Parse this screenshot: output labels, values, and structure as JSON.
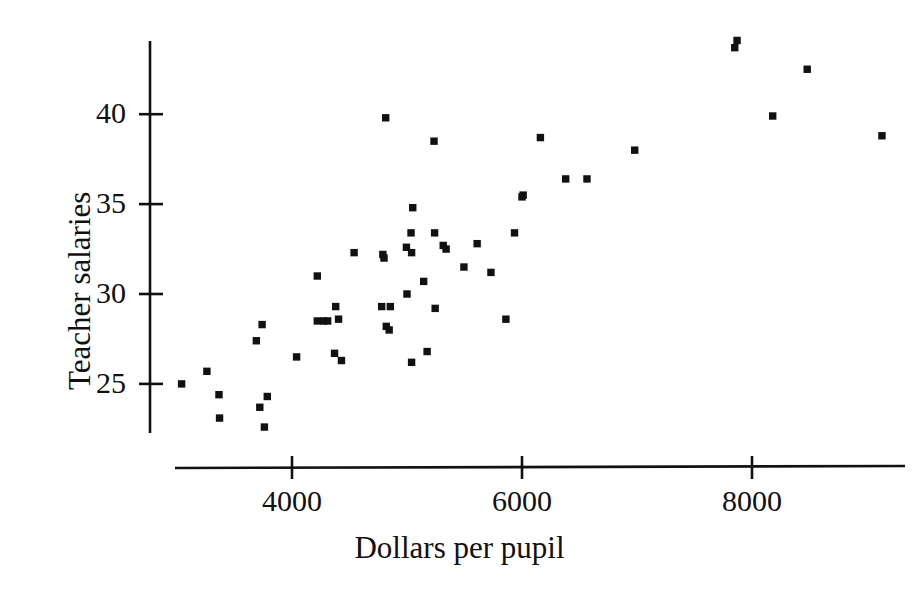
{
  "chart_data": {
    "type": "scatter",
    "title": "",
    "xlabel": "Dollars per pupil",
    "ylabel": "Teacher salaries",
    "xticks": [
      "4000",
      "6000",
      "8000"
    ],
    "xtick_values": [
      4000,
      6000,
      8000
    ],
    "yticks": [
      "25",
      "30",
      "35",
      "40"
    ],
    "ytick_values": [
      25,
      30,
      35,
      40
    ],
    "xlim": [
      3000,
      9300
    ],
    "ylim": [
      22.0,
      45.5
    ],
    "grid": false,
    "legend": null,
    "marker": "square",
    "marker_color": "#111111",
    "points": [
      {
        "x": 3040,
        "y": 25.0
      },
      {
        "x": 3260,
        "y": 25.7
      },
      {
        "x": 3365,
        "y": 24.4
      },
      {
        "x": 3370,
        "y": 23.1
      },
      {
        "x": 3690,
        "y": 27.4
      },
      {
        "x": 3740,
        "y": 28.3
      },
      {
        "x": 3720,
        "y": 23.7
      },
      {
        "x": 3785,
        "y": 24.3
      },
      {
        "x": 3760,
        "y": 22.6
      },
      {
        "x": 4040,
        "y": 26.5
      },
      {
        "x": 4220,
        "y": 31.0
      },
      {
        "x": 4220,
        "y": 28.5
      },
      {
        "x": 4275,
        "y": 28.5
      },
      {
        "x": 4310,
        "y": 28.5
      },
      {
        "x": 4370,
        "y": 26.7
      },
      {
        "x": 4380,
        "y": 29.3
      },
      {
        "x": 4405,
        "y": 28.6
      },
      {
        "x": 4430,
        "y": 26.3
      },
      {
        "x": 4540,
        "y": 32.3
      },
      {
        "x": 4780,
        "y": 29.3
      },
      {
        "x": 4790,
        "y": 32.2
      },
      {
        "x": 4800,
        "y": 32.0
      },
      {
        "x": 4815,
        "y": 39.8
      },
      {
        "x": 4820,
        "y": 28.2
      },
      {
        "x": 4845,
        "y": 28.0
      },
      {
        "x": 4855,
        "y": 29.3
      },
      {
        "x": 4995,
        "y": 32.6
      },
      {
        "x": 5000,
        "y": 30.0
      },
      {
        "x": 5035,
        "y": 33.4
      },
      {
        "x": 5040,
        "y": 32.3
      },
      {
        "x": 5040,
        "y": 26.2
      },
      {
        "x": 5050,
        "y": 34.8
      },
      {
        "x": 5145,
        "y": 30.7
      },
      {
        "x": 5175,
        "y": 26.8
      },
      {
        "x": 5235,
        "y": 38.5
      },
      {
        "x": 5240,
        "y": 33.4
      },
      {
        "x": 5245,
        "y": 29.2
      },
      {
        "x": 5315,
        "y": 32.7
      },
      {
        "x": 5340,
        "y": 32.5
      },
      {
        "x": 5495,
        "y": 31.5
      },
      {
        "x": 5610,
        "y": 32.8
      },
      {
        "x": 5730,
        "y": 31.2
      },
      {
        "x": 5860,
        "y": 28.6
      },
      {
        "x": 5935,
        "y": 33.4
      },
      {
        "x": 6000,
        "y": 35.4
      },
      {
        "x": 6010,
        "y": 35.5
      },
      {
        "x": 6160,
        "y": 38.7
      },
      {
        "x": 6380,
        "y": 36.4
      },
      {
        "x": 6565,
        "y": 36.4
      },
      {
        "x": 6980,
        "y": 38.0
      },
      {
        "x": 7850,
        "y": 43.7
      },
      {
        "x": 7870,
        "y": 44.1
      },
      {
        "x": 8180,
        "y": 39.9
      },
      {
        "x": 8480,
        "y": 42.5
      },
      {
        "x": 9130,
        "y": 38.8
      }
    ]
  }
}
